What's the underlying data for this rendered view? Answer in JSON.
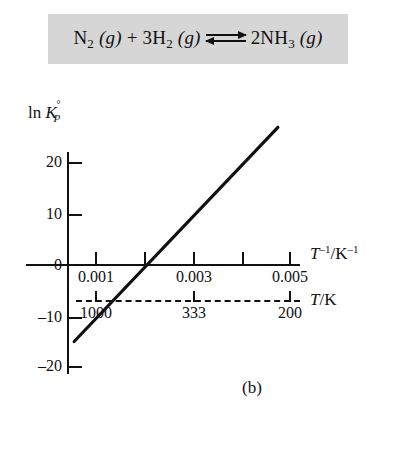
{
  "figure": {
    "caption": "(b)",
    "equation": {
      "reactant1": "N",
      "reactant1_sub": "2",
      "reactant1_state": " (g)",
      "plus": " + ",
      "reactant2_coeff": "3",
      "reactant2": "H",
      "reactant2_sub": "2",
      "reactant2_state": " (g)",
      "product_coeff": "2",
      "product": "NH",
      "product_sub": "3",
      "product_state": " (g)",
      "arrow_name": "equilibrium-double-arrow",
      "full_text": "N2 (g) + 3H2 (g) ⇌ 2NH3 (g)"
    },
    "banner_color": "#d6d6d6",
    "line_color": "#111111"
  },
  "chart_data": {
    "type": "line",
    "title": "",
    "subtitle": "",
    "xlabel": "T⁻¹/K⁻¹",
    "ylabel": "ln K_P°",
    "ylabel_parts": {
      "prefix": "ln ",
      "symbol": "K",
      "subscript": "P",
      "superscript": "°"
    },
    "xlabel_parts": {
      "symbol": "T",
      "exponent": "–1",
      "divider": "/K",
      "unit_exponent": "–1"
    },
    "secondary_axis": {
      "label": "T/K",
      "label_parts": {
        "symbol": "T",
        "divider": "/K"
      },
      "style": "dashed",
      "tick_values": [
        1000,
        333,
        200
      ],
      "tick_labels": [
        "1000",
        "333",
        "200"
      ],
      "tick_positions_x": [
        0.001,
        0.003,
        0.005
      ]
    },
    "x": [
      0.00055,
      0.00475
    ],
    "y": [
      -15.0,
      27.0
    ],
    "series": [
      {
        "name": "ln K_P° vs 1/T",
        "x": [
          0.00055,
          0.00475
        ],
        "y": [
          -15.0,
          27.0
        ],
        "color": "#111111",
        "width": 3.2
      }
    ],
    "xlim": [
      0.0,
      0.0055
    ],
    "ylim": [
      -22.0,
      25.5
    ],
    "xticks": [
      0.001,
      0.002,
      0.003,
      0.004,
      0.005
    ],
    "xtick_labels": [
      "0.001",
      "",
      "0.003",
      "",
      "0.005"
    ],
    "yticks": [
      20,
      10,
      0,
      -10,
      -20
    ],
    "ytick_labels": [
      "20",
      "10",
      "0",
      "–10",
      "–20"
    ],
    "grid": false,
    "legend": "none",
    "x_intercept": 0.0017,
    "annotations": []
  }
}
